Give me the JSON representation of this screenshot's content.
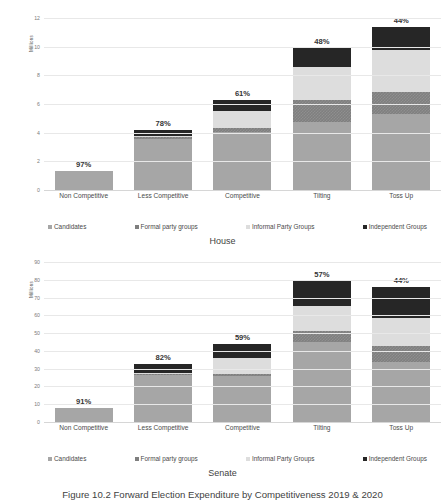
{
  "caption": "Figure 10.2   Forward Election Expenditure by Competitiveness 2019 & 2020",
  "legend": {
    "items": [
      {
        "label": "Candidates",
        "key": "candidates",
        "color": "#a6a6a6"
      },
      {
        "label": "Formal party groups",
        "key": "formal",
        "color": "#7f7f7f"
      },
      {
        "label": "Informal Party Groups",
        "key": "informal",
        "color": "#dddddd"
      },
      {
        "label": "Independent Groups",
        "key": "independent",
        "color": "#262626"
      }
    ]
  },
  "chart_data": [
    {
      "id": "house",
      "type": "bar",
      "stacked": true,
      "title": "House",
      "xlabel": "",
      "ylabel": "Millions",
      "ylim": [
        0,
        12
      ],
      "yticks": [
        0,
        2,
        4,
        6,
        8,
        10,
        12
      ],
      "grid": true,
      "legend_position": "bottom",
      "categories": [
        "Non Competitive",
        "Less Competitive",
        "Competitive",
        "Tilting",
        "Toss Up"
      ],
      "series": [
        {
          "name": "Candidates",
          "values": [
            1.3,
            3.55,
            4.05,
            4.75,
            5.3
          ]
        },
        {
          "name": "Formal party groups",
          "values": [
            0.03,
            0.15,
            0.3,
            1.5,
            1.55
          ]
        },
        {
          "name": "Informal Party Groups",
          "values": [
            0.01,
            0.07,
            1.15,
            2.35,
            2.9
          ]
        },
        {
          "name": "Independent Groups",
          "values": [
            0.01,
            0.45,
            0.75,
            1.3,
            1.65
          ]
        }
      ],
      "totals": [
        1.35,
        4.22,
        6.25,
        9.9,
        11.4
      ],
      "annotations": [
        "97%",
        "78%",
        "61%",
        "48%",
        "44%"
      ]
    },
    {
      "id": "senate",
      "type": "bar",
      "stacked": true,
      "title": "Senate",
      "xlabel": "",
      "ylabel": "Millions",
      "ylim": [
        0,
        90
      ],
      "yticks": [
        0,
        10,
        20,
        30,
        40,
        50,
        60,
        70,
        80,
        90
      ],
      "grid": true,
      "legend_position": "bottom",
      "categories": [
        "Non Competitive",
        "Less Competitive",
        "Competitive",
        "Tilting",
        "Toss Up"
      ],
      "series": [
        {
          "name": "Candidates",
          "values": [
            7.8,
            26.5,
            26.0,
            45.0,
            34.0
          ]
        },
        {
          "name": "Formal party groups",
          "values": [
            0.2,
            0.6,
            1.0,
            6.0,
            8.5
          ]
        },
        {
          "name": "Informal Party Groups",
          "values": [
            0.0,
            0.2,
            9.0,
            14.5,
            16.0
          ]
        },
        {
          "name": "Independent Groups",
          "values": [
            0.0,
            5.2,
            8.0,
            14.0,
            17.5
          ]
        }
      ],
      "totals": [
        8.0,
        32.5,
        44.0,
        79.5,
        76.0
      ],
      "annotations": [
        "91%",
        "82%",
        "59%",
        "57%",
        "44%"
      ]
    }
  ]
}
